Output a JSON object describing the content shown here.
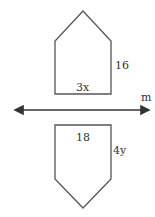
{
  "diagram": {
    "top_shape": {
      "base_label": "3x",
      "side_label": "16"
    },
    "line": {
      "label": "m"
    },
    "bottom_shape": {
      "base_label": "18",
      "side_label": "4y"
    }
  }
}
